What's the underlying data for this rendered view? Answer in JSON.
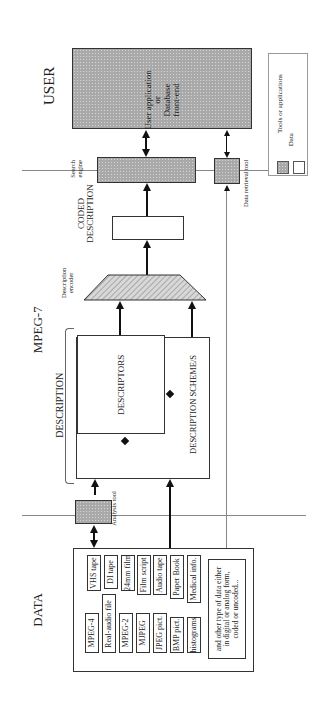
{
  "sections": {
    "user": "USER",
    "mpeg7": "MPEG-7",
    "data": "DATA",
    "description": "DESCRIPTION",
    "coded_description_line1": "CODED",
    "coded_description_line2": "DESCRIPTION"
  },
  "blocks": {
    "user_app_line1": "User application",
    "user_app_line2": "or",
    "user_app_line3": "Database",
    "user_app_line4": "front-end",
    "search_engine_line1": "Search",
    "search_engine_line2": "engine",
    "data_retrieval_tool": "Data retrieval tool",
    "description_encoder_line1": "Description",
    "description_encoder_line2": "encoder",
    "descriptors": "DESCRIPTORS",
    "description_schemes": "DESCRIPTION SCHEME/S",
    "analysis_tool": "Analysis tool"
  },
  "legend": {
    "tools": "Tools or applications",
    "data": "Data"
  },
  "data_items": [
    "MPEG-4",
    "Real-audio file",
    "MPEG-2",
    "MJPEG",
    "JPEG pict.",
    "BMP pict.",
    "histograms",
    "VHS tape",
    "DI tape",
    "24mm film",
    "Film script",
    "Audio tape",
    "Paper Book",
    "Medical info."
  ],
  "data_note_line1": "and other type of data either",
  "data_note_line2": "in digital or analog form,",
  "data_note_line3": "coded or uncoded..."
}
